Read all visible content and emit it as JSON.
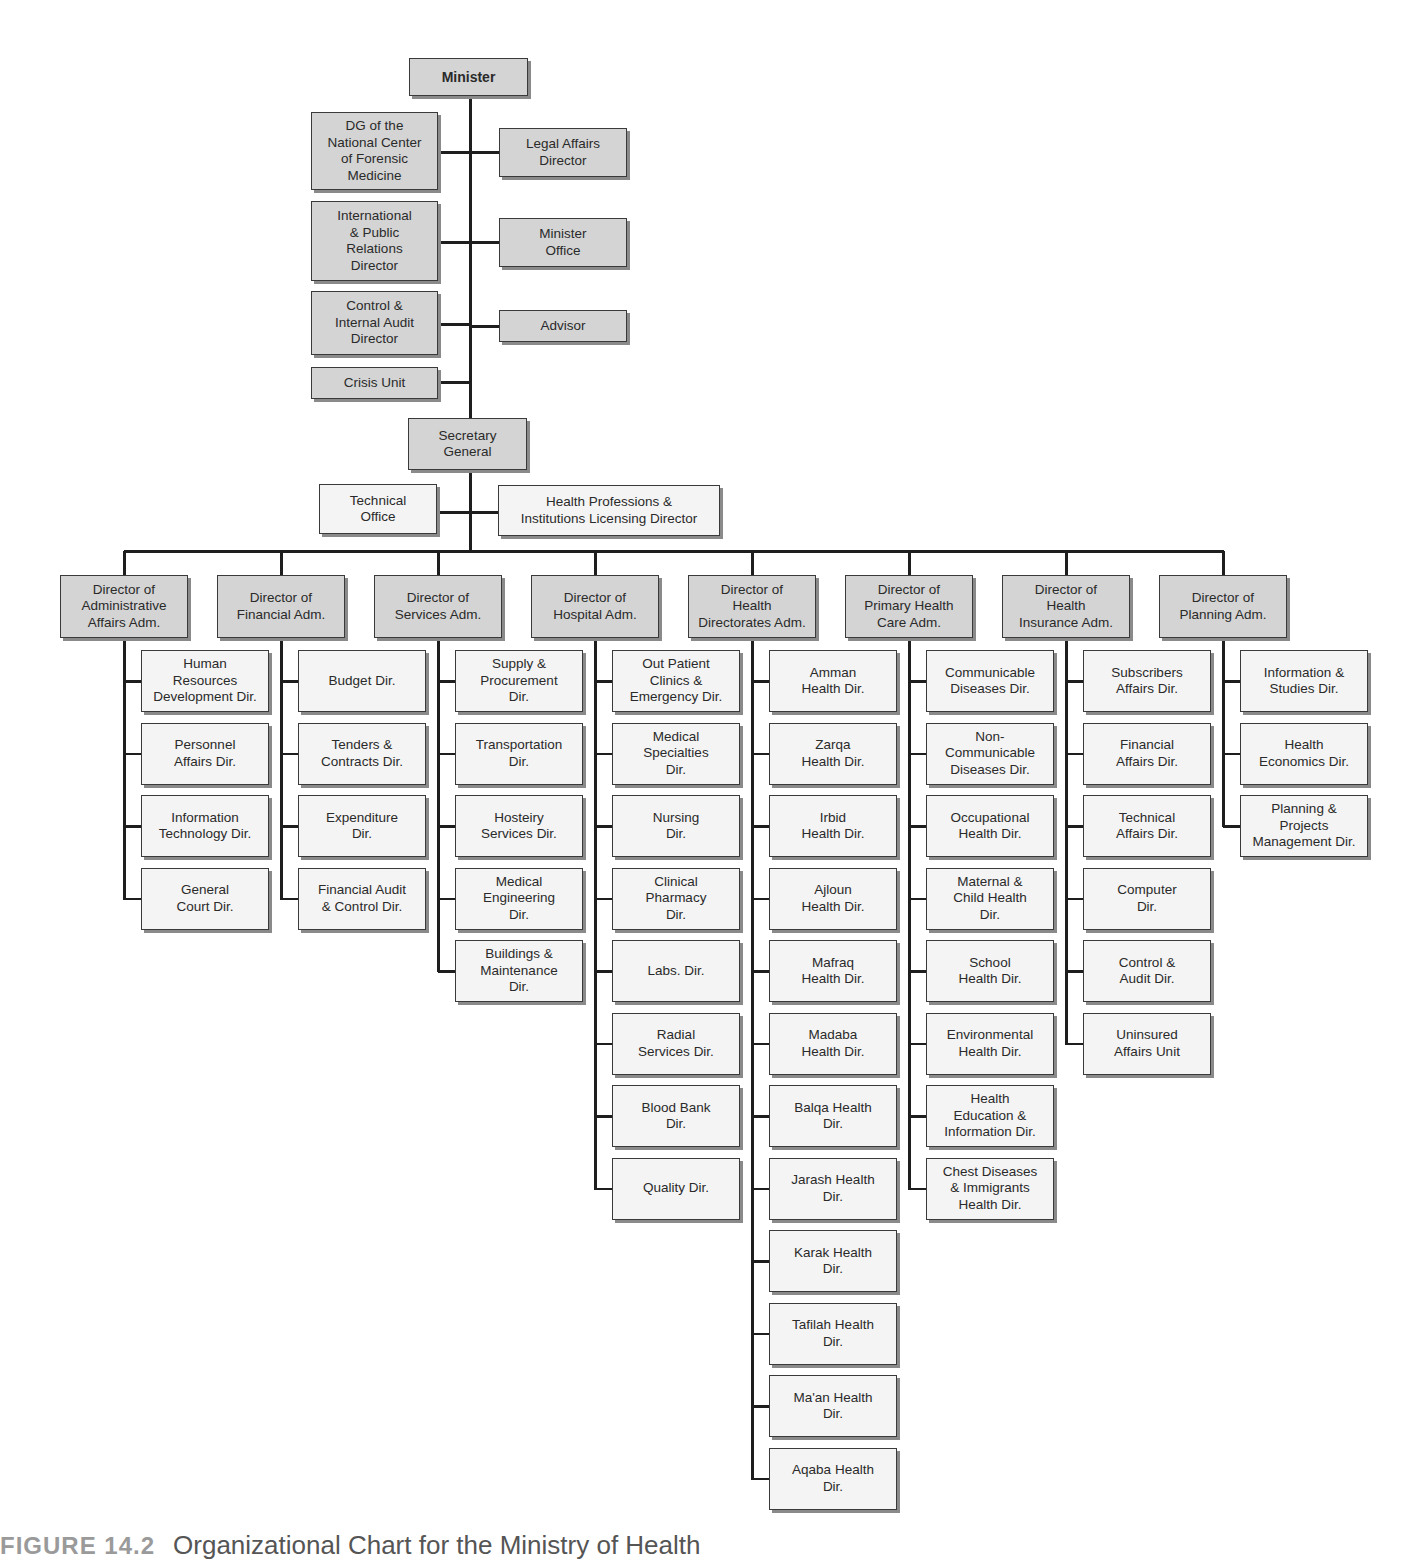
{
  "title": "Organizational Chart for the Ministry of Health",
  "caption": {
    "figure_label": "FIGURE 14.2",
    "text": "Organizational Chart for the Ministry of Health"
  },
  "colors": {
    "shaded_box": "#d4d4d4",
    "plain_box": "#f4f4f4",
    "line": "#1e1e1e",
    "border": "#3a3a3a"
  },
  "top": {
    "minister": {
      "label": "Minister",
      "x": 409,
      "y": 58,
      "w": 119,
      "h": 38
    },
    "spine_x": 470,
    "left_units": [
      {
        "label": "DG of the\nNational Center\nof Forensic\nMedicine",
        "x": 311,
        "y": 112,
        "w": 127,
        "h": 78,
        "link_y": 152
      },
      {
        "label": "International\n& Public\nRelations\nDirector",
        "x": 311,
        "y": 201,
        "w": 127,
        "h": 80,
        "link_y": 242
      },
      {
        "label": "Control &\nInternal Audit\nDirector",
        "x": 311,
        "y": 291,
        "w": 127,
        "h": 64,
        "link_y": 324
      },
      {
        "label": "Crisis Unit",
        "x": 311,
        "y": 367,
        "w": 127,
        "h": 32,
        "link_y": 382
      }
    ],
    "right_units": [
      {
        "label": "Legal Affairs\nDirector",
        "x": 499,
        "y": 128,
        "w": 128,
        "h": 49,
        "link_y": 152
      },
      {
        "label": "Minister\nOffice",
        "x": 499,
        "y": 218,
        "w": 128,
        "h": 49,
        "link_y": 242
      },
      {
        "label": "Advisor",
        "x": 499,
        "y": 310,
        "w": 128,
        "h": 32,
        "link_y": 326
      }
    ],
    "secretary_general": {
      "label": "Secretary\nGeneral",
      "x": 408,
      "y": 418,
      "w": 119,
      "h": 52
    },
    "sg_left": {
      "label": "Technical\nOffice",
      "x": 319,
      "y": 484,
      "w": 118,
      "h": 50,
      "link_y": 512
    },
    "sg_right": {
      "label": "Health Professions &\nInstitutions Licensing Director",
      "x": 498,
      "y": 485,
      "w": 222,
      "h": 51,
      "link_y": 512
    },
    "bus_y": 551,
    "bus_x1": 124,
    "bus_x2": 1224
  },
  "departments": [
    {
      "director": "Director of\nAdministrative\nAffairs Adm.",
      "x": 60,
      "children": [
        "Human\nResources\nDevelopment Dir.",
        "Personnel\nAffairs Dir.",
        "Information\nTechnology Dir.",
        "General\nCourt Dir."
      ]
    },
    {
      "director": "Director of\nFinancial Adm.",
      "x": 217,
      "children": [
        "Budget Dir.",
        "Tenders &\nContracts Dir.",
        "Expenditure\nDir.",
        "Financial Audit\n& Control Dir."
      ]
    },
    {
      "director": "Director of\nServices Adm.",
      "x": 374,
      "children": [
        "Supply &\nProcurement\nDir.",
        "Transportation\nDir.",
        "Hosteiry\nServices Dir.",
        "Medical\nEngineering\nDir.",
        "Buildings &\nMaintenance\nDir."
      ]
    },
    {
      "director": "Director of\nHospital Adm.",
      "x": 531,
      "children": [
        "Out Patient\nClinics &\nEmergency Dir.",
        "Medical\nSpecialties\nDir.",
        "Nursing\nDir.",
        "Clinical\nPharmacy\nDir.",
        "Labs. Dir.",
        "Radial\nServices Dir.",
        "Blood Bank\nDir.",
        "Quality Dir."
      ]
    },
    {
      "director": "Director of\nHealth\nDirectorates Adm.",
      "x": 688,
      "children": [
        "Amman\nHealth Dir.",
        "Zarqa\nHealth Dir.",
        "Irbid\nHealth Dir.",
        "Ajloun\nHealth Dir.",
        "Mafraq\nHealth Dir.",
        "Madaba\nHealth Dir.",
        "Balqa Health\nDir.",
        "Jarash Health\nDir.",
        "Karak Health\nDir.",
        "Tafilah Health\nDir.",
        "Ma'an Health\nDir.",
        "Aqaba Health\nDir."
      ]
    },
    {
      "director": "Director of\nPrimary Health\nCare Adm.",
      "x": 845,
      "children": [
        "Communicable\nDiseases Dir.",
        "Non-\nCommunicable\nDiseases Dir.",
        "Occupational\nHealth Dir.",
        "Maternal &\nChild Health\nDir.",
        "School\nHealth Dir.",
        "Environmental\nHealth Dir.",
        "Health\nEducation &\nInformation Dir.",
        "Chest Diseases\n& Immigrants\nHealth Dir."
      ]
    },
    {
      "director": "Director of\nHealth\nInsurance Adm.",
      "x": 1002,
      "children": [
        "Subscribers\nAffairs Dir.",
        "Financial\nAffairs Dir.",
        "Technical\nAffairs Dir.",
        "Computer\nDir.",
        "Control &\nAudit Dir.",
        "Uninsured\nAffairs Unit"
      ]
    },
    {
      "director": "Director of\nPlanning Adm.",
      "x": 1159,
      "children": [
        "Information &\nStudies Dir.",
        "Health\nEconomics Dir.",
        "Planning &\nProjects\nManagement Dir."
      ]
    }
  ],
  "layout": {
    "director_y": 575,
    "director_w": 128,
    "director_h": 63,
    "child_offset_x": 81,
    "child_w": 128,
    "child_h": 62,
    "child_first_y": 650,
    "child_step": 72.5,
    "branch_offset_x": 64
  }
}
